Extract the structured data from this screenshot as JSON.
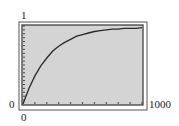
{
  "chart_data": {
    "type": "line",
    "title": "",
    "xlabel": "",
    "ylabel": "",
    "xlim": [
      0,
      1000
    ],
    "ylim": [
      0,
      1
    ],
    "x_tick_labels": {
      "min": "0",
      "max": "1000"
    },
    "y_tick_labels": {
      "min": "0",
      "max": "1"
    },
    "x_tick_count": 10,
    "y_tick_count": 20,
    "grid": false,
    "legend": null,
    "series": [
      {
        "name": "curve",
        "x": [
          0,
          50,
          100,
          150,
          200,
          250,
          300,
          350,
          400,
          450,
          500,
          550,
          600,
          650,
          700,
          750,
          800,
          850,
          900,
          950,
          1000
        ],
        "values": [
          0.0,
          0.2,
          0.36,
          0.49,
          0.59,
          0.68,
          0.74,
          0.79,
          0.83,
          0.87,
          0.89,
          0.91,
          0.93,
          0.94,
          0.95,
          0.96,
          0.96,
          0.97,
          0.97,
          0.97,
          0.98
        ]
      }
    ],
    "colors": {
      "background": "#d4d4d4",
      "line": "#2a2a2a",
      "frame": "#333333"
    }
  }
}
